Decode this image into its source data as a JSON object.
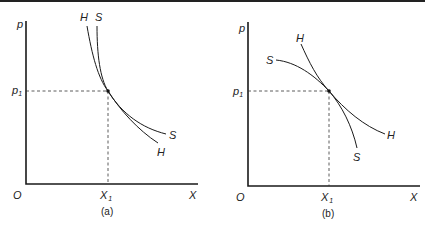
{
  "figure": {
    "panels": [
      {
        "id": "a",
        "caption": "(a)",
        "y_axis_label": "p",
        "x_axis_label": "X",
        "origin_label": "O",
        "price_level_label": "p",
        "price_level_sub": "1",
        "quantity_level_label": "X",
        "quantity_level_sub": "1",
        "curves": [
          {
            "name": "H",
            "top_label": "H",
            "bottom_label": "H",
            "description": "steeper at bottom; tangent to S at (X1, p1)"
          },
          {
            "name": "S",
            "top_label": "S",
            "bottom_label": "S",
            "description": "flatter at bottom; tangent to H at (X1, p1)"
          }
        ]
      },
      {
        "id": "b",
        "caption": "(b)",
        "y_axis_label": "p",
        "x_axis_label": "X",
        "origin_label": "O",
        "price_level_label": "p",
        "price_level_sub": "1",
        "quantity_level_label": "X",
        "quantity_level_sub": "1",
        "curves": [
          {
            "name": "H",
            "top_label": "H",
            "bottom_label": "H",
            "description": "convex curve crossing S at (X1, p1)"
          },
          {
            "name": "S",
            "top_label": "S",
            "bottom_label": "S",
            "description": "concave curve crossing H at (X1, p1)"
          }
        ]
      }
    ]
  }
}
